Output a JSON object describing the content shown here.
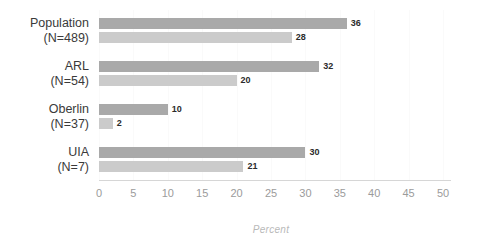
{
  "chart_data": {
    "type": "bar",
    "orientation": "horizontal",
    "title": "",
    "xlabel": "Percent",
    "ylabel": "",
    "xlim": [
      0,
      50
    ],
    "xticks": [
      0,
      5,
      10,
      15,
      20,
      25,
      30,
      35,
      40,
      45,
      50
    ],
    "grid": true,
    "legend": "none",
    "categories": [
      {
        "label": "Population",
        "n_label": "(N=489)"
      },
      {
        "label": "ARL",
        "n_label": "(N=54)"
      },
      {
        "label": "Oberlin",
        "n_label": "(N=37)"
      },
      {
        "label": "UIA",
        "n_label": "(N=7)"
      }
    ],
    "series": [
      {
        "name": "series-1",
        "color": "#a9a9a9",
        "values": [
          36,
          32,
          10,
          30
        ]
      },
      {
        "name": "series-2",
        "color": "#cbcbcb",
        "values": [
          28,
          20,
          2,
          21
        ]
      }
    ],
    "bars": [
      {
        "group": "Population",
        "n_label": "(N=489)",
        "series": "series-1",
        "value": 36,
        "value_label": "36",
        "color": "#a9a9a9"
      },
      {
        "group": "Population",
        "n_label": "(N=489)",
        "series": "series-2",
        "value": 28,
        "value_label": "28",
        "color": "#cbcbcb"
      },
      {
        "group": "ARL",
        "n_label": "(N=54)",
        "series": "series-1",
        "value": 32,
        "value_label": "32",
        "color": "#a9a9a9"
      },
      {
        "group": "ARL",
        "n_label": "(N=54)",
        "series": "series-2",
        "value": 20,
        "value_label": "20",
        "color": "#cbcbcb"
      },
      {
        "group": "Oberlin",
        "n_label": "(N=37)",
        "series": "series-1",
        "value": 10,
        "value_label": "10",
        "color": "#a9a9a9"
      },
      {
        "group": "Oberlin",
        "n_label": "(N=37)",
        "series": "series-2",
        "value": 2,
        "value_label": "2",
        "color": "#cbcbcb"
      },
      {
        "group": "UIA",
        "n_label": "(N=7)",
        "series": "series-1",
        "value": 30,
        "value_label": "30",
        "color": "#a9a9a9"
      },
      {
        "group": "UIA",
        "n_label": "(N=7)",
        "series": "series-2",
        "value": 21,
        "value_label": "21",
        "color": "#cbcbcb"
      }
    ]
  },
  "colors": {
    "background": "#ffffff",
    "bar_dark": "#a9a9a9",
    "bar_light": "#cbcbcb",
    "axis_line": "#d6d6d6",
    "gridline": "#fafafa",
    "tick_text": "#9b9b9b",
    "category_text": "#3a3a3a",
    "value_text": "#2b2b2b",
    "axis_title_text": "#b9b9b9"
  },
  "xticks": [
    {
      "label": "0",
      "value": 0
    },
    {
      "label": "5",
      "value": 5
    },
    {
      "label": "10",
      "value": 10
    },
    {
      "label": "15",
      "value": 15
    },
    {
      "label": "20",
      "value": 20
    },
    {
      "label": "25",
      "value": 25
    },
    {
      "label": "30",
      "value": 30
    },
    {
      "label": "35",
      "value": 35
    },
    {
      "label": "40",
      "value": 40
    },
    {
      "label": "45",
      "value": 45
    },
    {
      "label": "50",
      "value": 50
    }
  ],
  "axis": {
    "x_title": "Percent"
  }
}
